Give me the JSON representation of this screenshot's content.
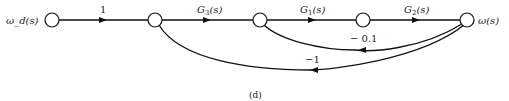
{
  "diagram": {
    "type": "signal-flow-graph",
    "caption": "(d)",
    "input_label": "ω_d(s)",
    "output_label": "ω(s)",
    "nodes": [
      {
        "id": "n1",
        "x": 52,
        "y": 20
      },
      {
        "id": "n2",
        "x": 155,
        "y": 20
      },
      {
        "id": "n3",
        "x": 260,
        "y": 20
      },
      {
        "id": "n4",
        "x": 363,
        "y": 20
      },
      {
        "id": "n5",
        "x": 467,
        "y": 20
      }
    ],
    "branches": [
      {
        "from": "n1",
        "to": "n2",
        "gain": "1"
      },
      {
        "from": "n2",
        "to": "n3",
        "gain": "G3(s)",
        "gain_main": "G",
        "gain_sub": "3",
        "gain_arg": "(s)"
      },
      {
        "from": "n3",
        "to": "n4",
        "gain": "G1(s)",
        "gain_main": "G",
        "gain_sub": "1",
        "gain_arg": "(s)"
      },
      {
        "from": "n4",
        "to": "n5",
        "gain": "G2(s)",
        "gain_main": "G",
        "gain_sub": "2",
        "gain_arg": "(s)"
      },
      {
        "from": "n5",
        "to": "n3",
        "gain": "− 0.1"
      },
      {
        "from": "n5",
        "to": "n2",
        "gain": "−1"
      }
    ]
  }
}
